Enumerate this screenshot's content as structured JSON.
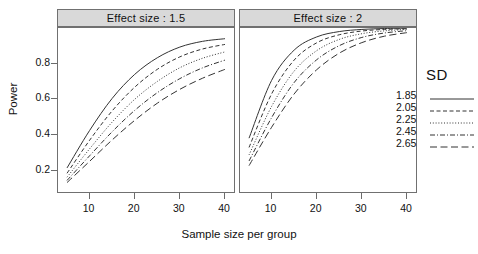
{
  "chart_data": {
    "type": "line",
    "title": "",
    "xlabel": "Sample size per group",
    "ylabel": "Power",
    "xlim": [
      3,
      42
    ],
    "ylim": [
      0.08,
      1.0
    ],
    "xticks": [
      10,
      20,
      30,
      40
    ],
    "yticks": [
      0.2,
      0.4,
      0.6,
      0.8
    ],
    "grid": false,
    "legend_position": "right",
    "legend_title": "SD",
    "panel_variable": "Effect size",
    "panels": [
      {
        "label": "Effect size : 1.5",
        "effect_size": 1.5,
        "x": [
          5,
          10,
          15,
          20,
          25,
          30,
          35,
          40
        ],
        "series": [
          {
            "name": "1.85",
            "linestyle": "solid",
            "values": [
              0.215,
              0.425,
              0.605,
              0.74,
              0.833,
              0.893,
              0.925,
              0.94
            ]
          },
          {
            "name": "2.05",
            "linestyle": "dashed",
            "values": [
              0.185,
              0.37,
              0.535,
              0.668,
              0.768,
              0.838,
              0.882,
              0.908
            ]
          },
          {
            "name": "2.25",
            "linestyle": "dotted",
            "values": [
              0.163,
              0.322,
              0.472,
              0.6,
              0.7,
              0.777,
              0.83,
              0.866
            ]
          },
          {
            "name": "2.45",
            "linestyle": "dashdot",
            "values": [
              0.145,
              0.283,
              0.418,
              0.538,
              0.637,
              0.716,
              0.776,
              0.82
            ]
          },
          {
            "name": "2.65",
            "linestyle": "longdash",
            "values": [
              0.133,
              0.252,
              0.372,
              0.482,
              0.578,
              0.656,
              0.718,
              0.768
            ]
          }
        ]
      },
      {
        "label": "Effect size : 2",
        "effect_size": 2,
        "x": [
          5,
          10,
          15,
          20,
          25,
          30,
          35,
          40
        ],
        "series": [
          {
            "name": "1.85",
            "linestyle": "solid",
            "values": [
              0.382,
              0.706,
              0.876,
              0.95,
              0.98,
              0.992,
              0.997,
              0.999
            ]
          },
          {
            "name": "2.05",
            "linestyle": "dashed",
            "values": [
              0.33,
              0.63,
              0.82,
              0.917,
              0.962,
              0.983,
              0.992,
              0.996
            ]
          },
          {
            "name": "2.25",
            "linestyle": "dotted",
            "values": [
              0.288,
              0.56,
              0.758,
              0.873,
              0.936,
              0.968,
              0.984,
              0.992
            ]
          },
          {
            "name": "2.45",
            "linestyle": "dashdot",
            "values": [
              0.254,
              0.497,
              0.694,
              0.822,
              0.901,
              0.947,
              0.972,
              0.985
            ]
          },
          {
            "name": "2.65",
            "linestyle": "longdash",
            "values": [
              0.228,
              0.443,
              0.63,
              0.766,
              0.859,
              0.918,
              0.954,
              0.974
            ]
          }
        ]
      }
    ],
    "legend_entries": [
      {
        "label": "1.85",
        "linestyle": "solid"
      },
      {
        "label": "2.05",
        "linestyle": "dashed"
      },
      {
        "label": "2.25",
        "linestyle": "dotted"
      },
      {
        "label": "2.45",
        "linestyle": "dashdot"
      },
      {
        "label": "2.65",
        "linestyle": "longdash"
      }
    ]
  },
  "axes": {
    "xlabel": "Sample size per group",
    "ylabel": "Power",
    "xtick_labels": [
      "10",
      "20",
      "30",
      "40"
    ],
    "ytick_labels": [
      "0.2",
      "0.4",
      "0.6",
      "0.8"
    ]
  },
  "legend": {
    "title": "SD",
    "items": [
      "1.85",
      "2.05",
      "2.25",
      "2.45",
      "2.65"
    ]
  },
  "panel_titles": [
    "Effect size : 1.5",
    "Effect size : 2"
  ],
  "colors": {
    "line": "#333333",
    "strip_background": "#d9d9d9",
    "border": "#707070",
    "text": "#111111",
    "background": "#ffffff"
  }
}
